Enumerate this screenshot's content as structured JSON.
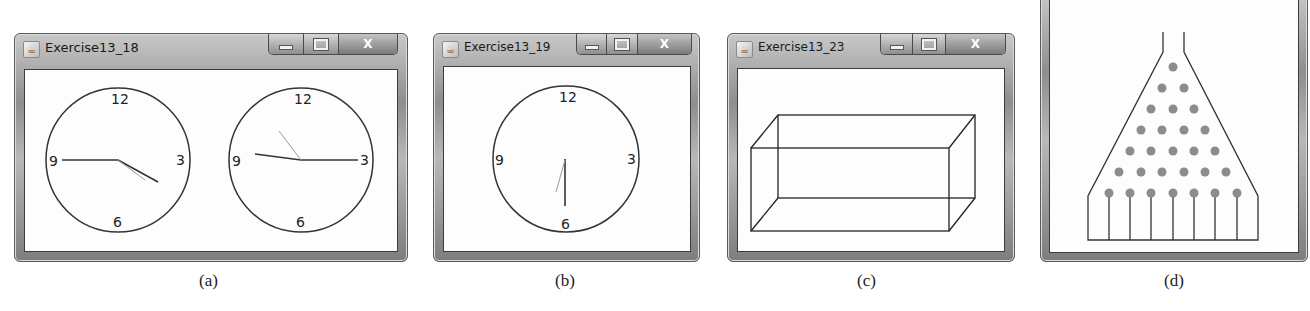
{
  "windows": [
    {
      "id": "a",
      "title": "Exercise13_18",
      "caption": "(a)",
      "buttons": {
        "minimize": "minimize",
        "maximize": "maximize",
        "close": "X"
      },
      "clocks": [
        {
          "labels": [
            "12",
            "3",
            "6",
            "9"
          ],
          "description": "hour/minute/second hands pointing toward 9 and about 4 o'clock"
        },
        {
          "labels": [
            "12",
            "3",
            "6",
            "9"
          ],
          "description": "hands pointing toward 3, 9 and about 11 o'clock"
        }
      ]
    },
    {
      "id": "b",
      "title": "Exercise13_19",
      "caption": "(b)",
      "buttons": {
        "minimize": "minimize",
        "maximize": "maximize",
        "close": "X"
      },
      "clock": {
        "labels": [
          "12",
          "3",
          "6",
          "9"
        ],
        "description": "hands pointing toward 6 and about 7 o'clock"
      }
    },
    {
      "id": "c",
      "title": "Exercise13_23",
      "caption": "(c)",
      "buttons": {
        "minimize": "minimize",
        "maximize": "maximize",
        "close": "X"
      },
      "drawing": "wireframe rectangular prism (cuboid)"
    },
    {
      "id": "d",
      "caption": "(d)",
      "drawing": "bean machine: funnel with 28 pegs in 7 rows and 8 slots",
      "peg_rows": 7,
      "slots": 8,
      "peg_color": "#8c8c8c"
    }
  ]
}
